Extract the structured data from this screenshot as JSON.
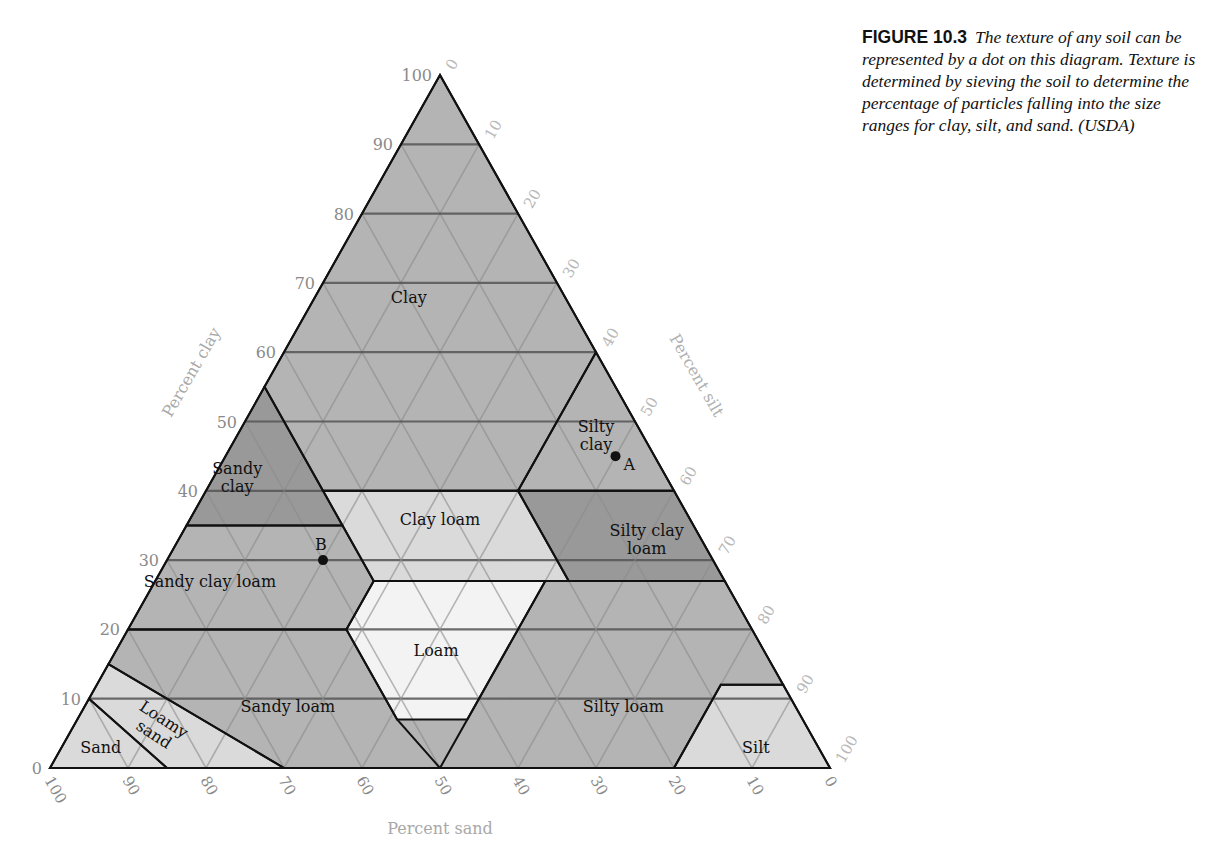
{
  "caption": {
    "figure_label": "FIGURE 10.3",
    "text": "The texture of any soil can be represented by a dot on this diagram. Texture is determined by sieving the soil to determine the percentage of particles falling into the size ranges for clay, silt, and sand. (USDA)"
  },
  "axes": {
    "clay_label": "Percent clay",
    "silt_label": "Percent silt",
    "sand_label": "Percent sand",
    "clay_ticks": [
      "0",
      "10",
      "20",
      "30",
      "40",
      "50",
      "60",
      "70",
      "80",
      "90",
      "100"
    ],
    "silt_ticks": [
      "0",
      "10",
      "20",
      "30",
      "40",
      "50",
      "60",
      "70",
      "80",
      "90",
      "100"
    ],
    "sand_ticks": [
      "100",
      "90",
      "80",
      "70",
      "60",
      "50",
      "40",
      "30",
      "20",
      "10",
      "0"
    ]
  },
  "colors": {
    "medium": "#b4b4b4",
    "dark": "#999999",
    "light": "#dadada",
    "lightest": "#f3f3f3",
    "grid_minor": "#8c8c8c",
    "grid_major": "#555555",
    "tick_text": "#8a8a8a",
    "axis_label": "#a8a8a8"
  },
  "chart_data": {
    "type": "ternary",
    "axes": [
      "clay",
      "silt",
      "sand"
    ],
    "regions": [
      {
        "name": "Clay",
        "label": "Clay",
        "shade": "medium",
        "vertices_sand_clay": [
          [
            0,
            100
          ],
          [
            0,
            60
          ],
          [
            20,
            40
          ],
          [
            45,
            40
          ],
          [
            45,
            55
          ],
          [
            0,
            100
          ]
        ],
        "label_at": [
          20,
          68
        ]
      },
      {
        "name": "Sandy clay",
        "label": "Sandy\nclay",
        "shade": "dark",
        "vertices_sand_clay": [
          [
            45,
            55
          ],
          [
            65,
            35
          ],
          [
            45,
            35
          ],
          [
            45,
            55
          ]
        ],
        "label_at": [
          55,
          42
        ]
      },
      {
        "name": "Silty clay",
        "label": "Silty\nclay",
        "shade": "medium",
        "vertices_sand_clay": [
          [
            0,
            60
          ],
          [
            0,
            40
          ],
          [
            20,
            40
          ],
          [
            0,
            60
          ]
        ],
        "label_at": [
          6,
          48
        ]
      },
      {
        "name": "Clay loam",
        "label": "Clay loam",
        "shade": "light",
        "vertices_sand_clay": [
          [
            20,
            40
          ],
          [
            45,
            40
          ],
          [
            45,
            27
          ],
          [
            20,
            27
          ]
        ],
        "label_at": [
          32,
          36
        ]
      },
      {
        "name": "Silty clay loam",
        "label": "Silty clay\nloam",
        "shade": "dark",
        "vertices_sand_clay": [
          [
            0,
            40
          ],
          [
            20,
            40
          ],
          [
            20,
            27
          ],
          [
            0,
            27
          ]
        ],
        "label_at": [
          7,
          33
        ]
      },
      {
        "name": "Sandy clay loam",
        "label": "Sandy clay loam",
        "shade": "medium",
        "vertices_sand_clay": [
          [
            45,
            35
          ],
          [
            65,
            35
          ],
          [
            80,
            20
          ],
          [
            52,
            20
          ],
          [
            45,
            27
          ]
        ],
        "label_at": [
          66,
          27
        ]
      },
      {
        "name": "Loam",
        "label": "Loam",
        "shade": "lightest",
        "vertices_sand_clay": [
          [
            45,
            27
          ],
          [
            52,
            20
          ],
          [
            52,
            7
          ],
          [
            43,
            7
          ],
          [
            23,
            27
          ]
        ],
        "label_at": [
          42,
          17
        ]
      },
      {
        "name": "Sandy loam",
        "label": "Sandy loam",
        "shade": "medium",
        "vertices_sand_clay": [
          [
            52,
            20
          ],
          [
            80,
            20
          ],
          [
            85,
            15
          ],
          [
            70,
            0
          ],
          [
            50,
            0
          ],
          [
            52,
            7
          ]
        ],
        "label_at": [
          65,
          9
        ]
      },
      {
        "name": "Silty loam",
        "label": "Silty loam",
        "shade": "medium",
        "vertices_sand_clay": [
          [
            23,
            27
          ],
          [
            50,
            0
          ],
          [
            20,
            0
          ],
          [
            8,
            12
          ],
          [
            0,
            12
          ],
          [
            0,
            27
          ]
        ],
        "label_at": [
          22,
          9
        ]
      },
      {
        "name": "Silt",
        "label": "Silt",
        "shade": "light",
        "vertices_sand_clay": [
          [
            20,
            0
          ],
          [
            8,
            12
          ],
          [
            0,
            12
          ],
          [
            0,
            0
          ]
        ],
        "label_at": [
          8,
          3
        ]
      },
      {
        "name": "Loamy sand",
        "label": "Loamy\nsand",
        "shade": "light",
        "vertices_sand_clay": [
          [
            85,
            15
          ],
          [
            90,
            10
          ],
          [
            85,
            0
          ],
          [
            70,
            0
          ]
        ],
        "label_at": [
          83,
          6
        ]
      },
      {
        "name": "Sand",
        "label": "Sand",
        "shade": "light",
        "vertices_sand_clay": [
          [
            90,
            10
          ],
          [
            100,
            0
          ],
          [
            85,
            0
          ]
        ],
        "label_at": [
          92,
          3
        ]
      }
    ],
    "points": [
      {
        "label": "A",
        "sand": 5,
        "clay": 45,
        "silt": 50
      },
      {
        "label": "B",
        "sand": 50,
        "clay": 30,
        "silt": 20
      }
    ],
    "grid_step": 10
  }
}
